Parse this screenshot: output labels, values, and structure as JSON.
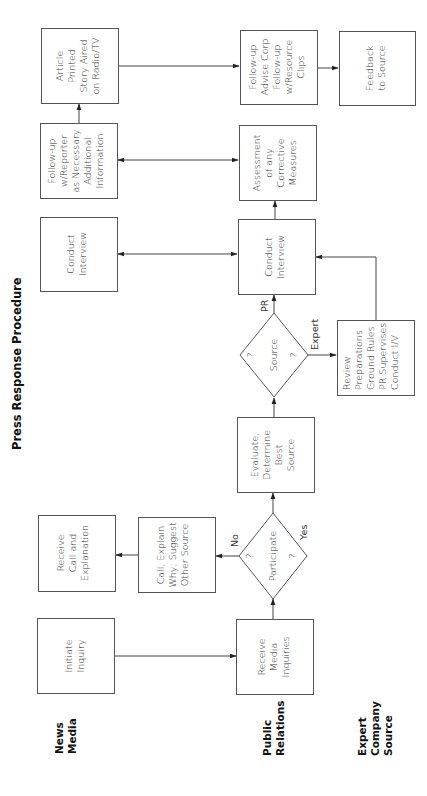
{
  "title": "Press Response Procedure",
  "lanes": [
    {
      "line1": "News",
      "line2": "Media",
      "line3": ""
    },
    {
      "line1": "Public",
      "line2": "Relations",
      "line3": ""
    },
    {
      "line1": "Expert",
      "line2": "Company",
      "line3": "Source"
    }
  ],
  "nodes": {
    "initiate_inquiry": {
      "lines": [
        "Initiate",
        "Inquiry"
      ]
    },
    "receive_media_inquiries": {
      "lines": [
        "Receive",
        "Media",
        "Inquiries"
      ]
    },
    "participate": {
      "label": "Participate",
      "q1": "?",
      "q2": "?"
    },
    "call_explain": {
      "lines": [
        "Call, Explain",
        "Why; Suggest",
        "Other Source"
      ]
    },
    "receive_call": {
      "lines": [
        "Receive",
        "Call and",
        "Explanation"
      ]
    },
    "evaluate": {
      "lines": [
        "Evaluate,",
        "Determine",
        "Best",
        "Source"
      ]
    },
    "source": {
      "label": "Source",
      "q1": "?",
      "q2": "?"
    },
    "review": {
      "lines": [
        "Review",
        "Preparations",
        "Ground Rules",
        "PR Supervises",
        "Conduct I/V"
      ]
    },
    "conduct_interview_pr": {
      "lines": [
        "Conduct",
        "Interview"
      ]
    },
    "conduct_interview_media": {
      "lines": [
        "Conduct",
        "Interview"
      ]
    },
    "assessment": {
      "lines": [
        "Assessment",
        "of any",
        "Corrective",
        "Measures"
      ]
    },
    "followup_reporter": {
      "lines": [
        "Follow-up",
        "w/Reporter",
        "as Necessary",
        "Additional",
        "Information"
      ]
    },
    "article_printed": {
      "lines": [
        "Article",
        "Printed",
        "Story Aired",
        "on Radio/TV"
      ]
    },
    "followup_advise": {
      "lines": [
        "Follow-up",
        "Advise Corp",
        "Follow-up",
        "w/Resource",
        "Clips"
      ]
    },
    "feedback": {
      "lines": [
        "Feedback",
        "to Source"
      ]
    }
  },
  "edge_labels": {
    "no": "No",
    "yes": "Yes",
    "pr": "PR",
    "expert": "Expert"
  }
}
